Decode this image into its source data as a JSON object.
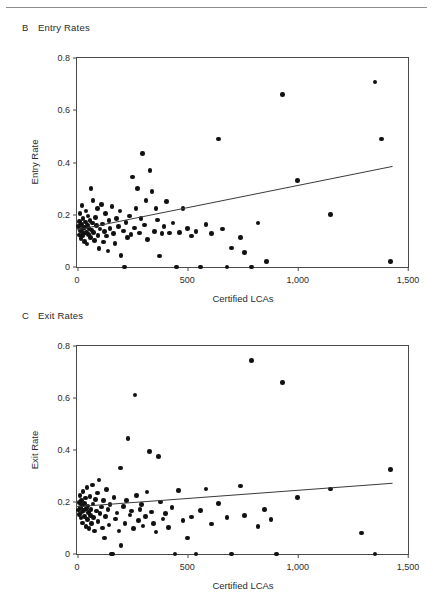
{
  "figure": {
    "has_top_rule": true,
    "panels": [
      {
        "id": "B",
        "letter": "B",
        "title": "Entry Rates"
      },
      {
        "id": "C",
        "letter": "C",
        "title": "Exit Rates"
      }
    ]
  },
  "chart_data": [
    {
      "type": "scatter",
      "panel": "B",
      "title": "Entry Rates",
      "xlabel": "Certified LCAs",
      "ylabel": "Entry Rate",
      "xlim": [
        0,
        1500
      ],
      "ylim": [
        0,
        0.8
      ],
      "xticks": [
        0,
        500,
        1000,
        1500
      ],
      "xticklabels": [
        "0",
        "500",
        "1,000",
        "1,500"
      ],
      "yticks": [
        0,
        0.2,
        0.4,
        0.6,
        0.8
      ],
      "yticklabels": [
        "0",
        "0.2",
        "0.4",
        "0.6",
        "0.8"
      ],
      "grid": false,
      "legend": null,
      "fit_line": {
        "x0": 0,
        "y0": 0.142,
        "x1": 1430,
        "y1": 0.385
      },
      "points": [
        [
          8,
          0.155
        ],
        [
          10,
          0.122
        ],
        [
          12,
          0.175
        ],
        [
          14,
          0.205
        ],
        [
          16,
          0.138
        ],
        [
          18,
          0.108
        ],
        [
          20,
          0.162
        ],
        [
          22,
          0.235
        ],
        [
          24,
          0.145
        ],
        [
          26,
          0.118
        ],
        [
          28,
          0.185
        ],
        [
          30,
          0.128
        ],
        [
          33,
          0.152
        ],
        [
          35,
          0.098
        ],
        [
          38,
          0.172
        ],
        [
          40,
          0.215
        ],
        [
          42,
          0.133
        ],
        [
          45,
          0.088
        ],
        [
          48,
          0.16
        ],
        [
          50,
          0.195
        ],
        [
          53,
          0.125
        ],
        [
          55,
          0.148
        ],
        [
          58,
          0.178
        ],
        [
          60,
          0.112
        ],
        [
          63,
          0.3
        ],
        [
          66,
          0.142
        ],
        [
          70,
          0.168
        ],
        [
          73,
          0.255
        ],
        [
          76,
          0.132
        ],
        [
          80,
          0.102
        ],
        [
          84,
          0.19
        ],
        [
          88,
          0.158
        ],
        [
          92,
          0.225
        ],
        [
          96,
          0.12
        ],
        [
          100,
          0.07
        ],
        [
          105,
          0.145
        ],
        [
          110,
          0.24
        ],
        [
          115,
          0.165
        ],
        [
          120,
          0.095
        ],
        [
          125,
          0.135
        ],
        [
          130,
          0.205
        ],
        [
          135,
          0.118
        ],
        [
          140,
          0.062
        ],
        [
          145,
          0.178
        ],
        [
          150,
          0.148
        ],
        [
          158,
          0.232
        ],
        [
          165,
          0.128
        ],
        [
          172,
          0.09
        ],
        [
          180,
          0.185
        ],
        [
          188,
          0.155
        ],
        [
          195,
          0.215
        ],
        [
          200,
          0.045
        ],
        [
          210,
          0.138
        ],
        [
          215,
          0.0
        ],
        [
          222,
          0.17
        ],
        [
          230,
          0.112
        ],
        [
          238,
          0.195
        ],
        [
          245,
          0.125
        ],
        [
          252,
          0.345
        ],
        [
          260,
          0.15
        ],
        [
          268,
          0.225
        ],
        [
          275,
          0.3
        ],
        [
          282,
          0.13
        ],
        [
          290,
          0.185
        ],
        [
          298,
          0.435
        ],
        [
          305,
          0.16
        ],
        [
          312,
          0.255
        ],
        [
          320,
          0.105
        ],
        [
          330,
          0.37
        ],
        [
          340,
          0.29
        ],
        [
          350,
          0.135
        ],
        [
          358,
          0.225
        ],
        [
          365,
          0.18
        ],
        [
          375,
          0.042
        ],
        [
          385,
          0.128
        ],
        [
          395,
          0.155
        ],
        [
          405,
          0.25
        ],
        [
          420,
          0.13
        ],
        [
          435,
          0.168
        ],
        [
          450,
          0.0
        ],
        [
          465,
          0.132
        ],
        [
          480,
          0.225
        ],
        [
          500,
          0.148
        ],
        [
          520,
          0.118
        ],
        [
          540,
          0.135
        ],
        [
          560,
          0.0
        ],
        [
          585,
          0.162
        ],
        [
          610,
          0.128
        ],
        [
          640,
          0.49
        ],
        [
          660,
          0.145
        ],
        [
          680,
          0.0
        ],
        [
          700,
          0.072
        ],
        [
          740,
          0.112
        ],
        [
          760,
          0.055
        ],
        [
          790,
          0.0
        ],
        [
          820,
          0.168
        ],
        [
          860,
          0.022
        ],
        [
          930,
          0.66
        ],
        [
          1000,
          0.33
        ],
        [
          1150,
          0.2
        ],
        [
          1350,
          0.708
        ],
        [
          1380,
          0.49
        ],
        [
          1420,
          0.02
        ]
      ]
    },
    {
      "type": "scatter",
      "panel": "C",
      "title": "Exit Rates",
      "xlabel": "Certified LCAs",
      "ylabel": "Exit Rate",
      "xlim": [
        0,
        1500
      ],
      "ylim": [
        0,
        0.8
      ],
      "xticks": [
        0,
        500,
        1000,
        1500
      ],
      "xticklabels": [
        "0",
        "500",
        "1,000",
        "1,500"
      ],
      "yticks": [
        0,
        0.2,
        0.4,
        0.6,
        0.8
      ],
      "yticklabels": [
        "0",
        "0.2",
        "0.4",
        "0.6",
        "0.8"
      ],
      "grid": false,
      "legend": null,
      "fit_line": {
        "x0": 0,
        "y0": 0.182,
        "x1": 1430,
        "y1": 0.272
      },
      "points": [
        [
          8,
          0.17
        ],
        [
          10,
          0.198
        ],
        [
          12,
          0.152
        ],
        [
          14,
          0.225
        ],
        [
          16,
          0.178
        ],
        [
          18,
          0.138
        ],
        [
          20,
          0.205
        ],
        [
          22,
          0.162
        ],
        [
          24,
          0.188
        ],
        [
          26,
          0.12
        ],
        [
          28,
          0.24
        ],
        [
          30,
          0.168
        ],
        [
          33,
          0.195
        ],
        [
          35,
          0.145
        ],
        [
          38,
          0.215
        ],
        [
          40,
          0.105
        ],
        [
          42,
          0.175
        ],
        [
          45,
          0.255
        ],
        [
          48,
          0.132
        ],
        [
          50,
          0.185
        ],
        [
          53,
          0.16
        ],
        [
          55,
          0.098
        ],
        [
          58,
          0.222
        ],
        [
          60,
          0.148
        ],
        [
          63,
          0.172
        ],
        [
          66,
          0.118
        ],
        [
          70,
          0.265
        ],
        [
          73,
          0.192
        ],
        [
          76,
          0.14
        ],
        [
          80,
          0.088
        ],
        [
          84,
          0.21
        ],
        [
          88,
          0.165
        ],
        [
          92,
          0.235
        ],
        [
          96,
          0.125
        ],
        [
          100,
          0.285
        ],
        [
          105,
          0.155
        ],
        [
          110,
          0.18
        ],
        [
          115,
          0.1
        ],
        [
          120,
          0.205
        ],
        [
          125,
          0.062
        ],
        [
          130,
          0.145
        ],
        [
          135,
          0.248
        ],
        [
          140,
          0.172
        ],
        [
          145,
          0.112
        ],
        [
          150,
          0.19
        ],
        [
          155,
          0.0
        ],
        [
          160,
          0.0
        ],
        [
          168,
          0.218
        ],
        [
          175,
          0.135
        ],
        [
          182,
          0.158
        ],
        [
          190,
          0.088
        ],
        [
          196,
          0.33
        ],
        [
          200,
          0.032
        ],
        [
          210,
          0.182
        ],
        [
          218,
          0.118
        ],
        [
          225,
          0.205
        ],
        [
          232,
          0.445
        ],
        [
          240,
          0.15
        ],
        [
          248,
          0.165
        ],
        [
          255,
          0.098
        ],
        [
          262,
          0.612
        ],
        [
          270,
          0.225
        ],
        [
          278,
          0.128
        ],
        [
          285,
          0.172
        ],
        [
          292,
          0.19
        ],
        [
          300,
          0.108
        ],
        [
          310,
          0.145
        ],
        [
          318,
          0.238
        ],
        [
          328,
          0.395
        ],
        [
          338,
          0.162
        ],
        [
          348,
          0.118
        ],
        [
          358,
          0.085
        ],
        [
          368,
          0.375
        ],
        [
          378,
          0.2
        ],
        [
          390,
          0.135
        ],
        [
          400,
          0.155
        ],
        [
          415,
          0.102
        ],
        [
          430,
          0.178
        ],
        [
          445,
          0.0
        ],
        [
          460,
          0.245
        ],
        [
          480,
          0.128
        ],
        [
          500,
          0.062
        ],
        [
          520,
          0.142
        ],
        [
          540,
          0.0
        ],
        [
          560,
          0.168
        ],
        [
          585,
          0.25
        ],
        [
          610,
          0.115
        ],
        [
          640,
          0.195
        ],
        [
          680,
          0.14
        ],
        [
          700,
          0.0
        ],
        [
          740,
          0.262
        ],
        [
          760,
          0.148
        ],
        [
          790,
          0.745
        ],
        [
          820,
          0.105
        ],
        [
          850,
          0.172
        ],
        [
          880,
          0.132
        ],
        [
          905,
          0.0
        ],
        [
          930,
          0.66
        ],
        [
          1000,
          0.218
        ],
        [
          1150,
          0.25
        ],
        [
          1290,
          0.08
        ],
        [
          1350,
          0.0
        ],
        [
          1420,
          0.325
        ]
      ]
    }
  ]
}
